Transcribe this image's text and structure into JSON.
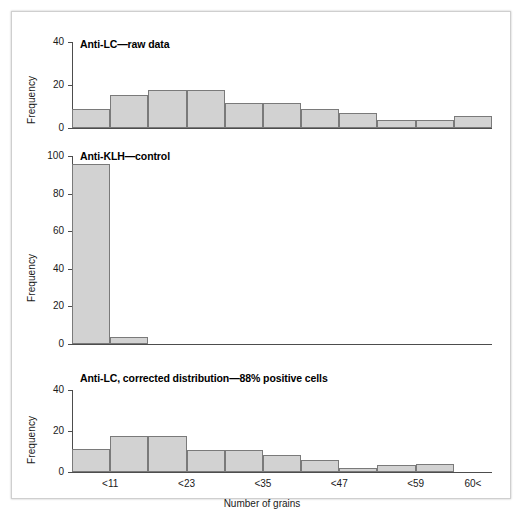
{
  "figure": {
    "background": "#ffffff",
    "bar_fill": "#d2d2d2",
    "bar_stroke": "#7a7a7a",
    "axis_color": "#4d4d4d",
    "xlabel": "Number of grains",
    "ylabel": "Frequency"
  },
  "chart_data": [
    {
      "type": "bar",
      "title": "Anti-LC—raw data",
      "xlabel": "",
      "ylabel": "Frequency",
      "ylim": [
        0,
        40
      ],
      "yticks": [
        0,
        20,
        40
      ],
      "yticklabels": [
        "0",
        "20",
        "40"
      ],
      "grid": false,
      "legend": "none",
      "categories": [
        "<11",
        "",
        "<23",
        "",
        "<35",
        "",
        "<47",
        "",
        "<59",
        "",
        "60<"
      ],
      "bin_edges": [
        0,
        6,
        12,
        18,
        24,
        30,
        36,
        42,
        48,
        54,
        60,
        66
      ],
      "values": [
        9,
        15.5,
        17.5,
        17.5,
        11.5,
        11.5,
        9,
        7,
        3.5,
        3.5,
        5.5
      ]
    },
    {
      "type": "bar",
      "title": "Anti-KLH—control",
      "xlabel": "",
      "ylabel": "Frequency",
      "ylim": [
        0,
        100
      ],
      "yticks": [
        0,
        20,
        40,
        60,
        80,
        100
      ],
      "yticklabels": [
        "0",
        "20",
        "40",
        "60",
        "80",
        "100"
      ],
      "grid": false,
      "legend": "none",
      "categories": [
        "<11",
        "",
        "<23",
        "",
        "<35",
        "",
        "<47",
        "",
        "<59",
        "",
        "60<"
      ],
      "bin_edges": [
        0,
        6,
        12,
        18,
        24,
        30,
        36,
        42,
        48,
        54,
        60,
        66
      ],
      "values": [
        96,
        3.5,
        0,
        0,
        0,
        0,
        0,
        0,
        0,
        0,
        0
      ]
    },
    {
      "type": "bar",
      "title": "Anti-LC, corrected distribution—88% positive cells",
      "xlabel": "Number of grains",
      "ylabel": "Frequency",
      "ylim": [
        0,
        40
      ],
      "yticks": [
        0,
        20,
        40
      ],
      "yticklabels": [
        "0",
        "20",
        "40"
      ],
      "grid": false,
      "legend": "none",
      "categories": [
        "<11",
        "",
        "<23",
        "",
        "<35",
        "",
        "<47",
        "",
        "<59",
        "",
        "60<"
      ],
      "xticklabels": [
        "<11",
        "<23",
        "<35",
        "<47",
        "<59",
        "60<"
      ],
      "xtick_positions": [
        1,
        3,
        5,
        7,
        9,
        10.5
      ],
      "bin_edges": [
        0,
        6,
        12,
        18,
        24,
        30,
        36,
        42,
        48,
        54,
        60,
        66
      ],
      "values": [
        11,
        17.5,
        17.5,
        10.5,
        10.5,
        8.5,
        6,
        2,
        3.5,
        4,
        0
      ]
    }
  ]
}
